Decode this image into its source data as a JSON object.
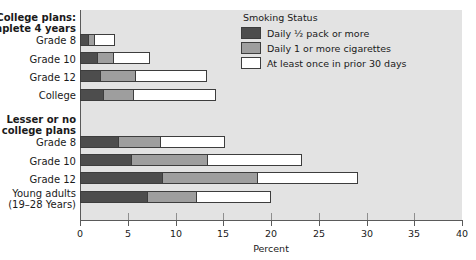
{
  "chart_data": {
    "type": "bar",
    "orientation": "horizontal",
    "stacked": true,
    "title": "",
    "xlabel": "Percent",
    "ylabel": "",
    "xlim": [
      0,
      40
    ],
    "xticks": [
      0,
      5,
      10,
      15,
      20,
      25,
      30,
      35,
      40
    ],
    "grid": false,
    "legend": {
      "title": "Smoking Status",
      "position": "top-right",
      "entries": [
        {
          "label": "Daily ½ pack or more",
          "color": "#4d4d4d"
        },
        {
          "label": "Daily 1 or more cigarettes",
          "color": "#9e9e9e"
        },
        {
          "label": "At least once in prior 30 days",
          "color": "#ffffff"
        }
      ]
    },
    "groups": [
      {
        "heading": "College plans:\nComplete 4 years",
        "categories": [
          "Grade 8",
          "Grade 10",
          "Grade 12",
          "College"
        ]
      },
      {
        "heading": "Lesser or no\ncollege plans",
        "categories": [
          "Grade 8",
          "Grade 10",
          "Grade 12",
          "Young adults\n(19–28 Years)"
        ]
      }
    ],
    "categories": [
      "Grade 8",
      "Grade 10",
      "Grade 12",
      "College",
      "Grade 8",
      "Grade 10",
      "Grade 12",
      "Young adults (19–28 Years)"
    ],
    "series": [
      {
        "name": "Daily ½ pack or more",
        "values": [
          0.8,
          1.8,
          2.1,
          2.4,
          4.0,
          5.3,
          8.6,
          7.0
        ]
      },
      {
        "name": "Daily 1 or more cigarettes",
        "values": [
          0.7,
          1.7,
          3.7,
          3.1,
          4.4,
          8.0,
          9.9,
          5.1
        ]
      },
      {
        "name": "At least once in prior 30 days",
        "values": [
          2.2,
          3.8,
          7.5,
          8.7,
          6.8,
          9.9,
          10.6,
          7.9
        ]
      }
    ],
    "totals": [
      3.7,
      7.3,
      13.3,
      14.2,
      15.2,
      23.2,
      29.1,
      20.0
    ]
  }
}
